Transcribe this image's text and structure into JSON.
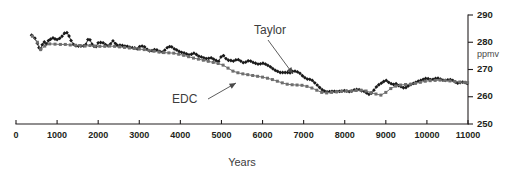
{
  "figure": {
    "background_color": "#ffffff",
    "text_color": "#231f20"
  },
  "axes": {
    "x_title": "Years",
    "y_unit": "ppmv",
    "x_ticks": [
      "0",
      "1000",
      "2000",
      "3000",
      "4000",
      "5000",
      "6000",
      "7000",
      "8000",
      "9000",
      "10000",
      "11000"
    ],
    "y_ticks": [
      "290",
      "280",
      "270",
      "260",
      "250"
    ]
  },
  "annotations": {
    "taylor": "Taylor",
    "edc": "EDC"
  },
  "chart_data": {
    "type": "line",
    "title": "",
    "xlabel": "Years",
    "ylabel": "ppmv",
    "xlim": [
      0,
      11000
    ],
    "ylim": [
      250,
      290
    ],
    "grid": false,
    "legend": "annotated-inline",
    "x_ticks": [
      0,
      1000,
      2000,
      3000,
      4000,
      5000,
      6000,
      7000,
      8000,
      9000,
      10000,
      11000
    ],
    "y_ticks": [
      250,
      260,
      270,
      280,
      290
    ],
    "series": [
      {
        "name": "Taylor",
        "color": "#1a1a1a",
        "marker": "filled-diamond",
        "points": [
          [
            380,
            282.6
          ],
          [
            460,
            281.5
          ],
          [
            520,
            279.6
          ],
          [
            560,
            278.0
          ],
          [
            600,
            277.4
          ],
          [
            640,
            279.1
          ],
          [
            690,
            280.1
          ],
          [
            740,
            279.4
          ],
          [
            790,
            280.6
          ],
          [
            840,
            281.1
          ],
          [
            900,
            281.6
          ],
          [
            950,
            281.2
          ],
          [
            1000,
            281.0
          ],
          [
            1060,
            281.4
          ],
          [
            1120,
            282.2
          ],
          [
            1180,
            283.3
          ],
          [
            1240,
            283.5
          ],
          [
            1290,
            282.3
          ],
          [
            1340,
            280.6
          ],
          [
            1400,
            279.2
          ],
          [
            1460,
            278.7
          ],
          [
            1520,
            278.6
          ],
          [
            1580,
            278.6
          ],
          [
            1640,
            278.7
          ],
          [
            1700,
            279.2
          ],
          [
            1750,
            281.0
          ],
          [
            1800,
            280.9
          ],
          [
            1850,
            279.3
          ],
          [
            1900,
            278.5
          ],
          [
            1950,
            278.4
          ],
          [
            2000,
            279.8
          ],
          [
            2060,
            279.9
          ],
          [
            2120,
            279.8
          ],
          [
            2180,
            279.1
          ],
          [
            2240,
            278.7
          ],
          [
            2300,
            279.4
          ],
          [
            2360,
            280.5
          ],
          [
            2420,
            279.5
          ],
          [
            2470,
            278.8
          ],
          [
            2530,
            278.9
          ],
          [
            2590,
            278.8
          ],
          [
            2650,
            278.6
          ],
          [
            2710,
            278.5
          ],
          [
            2770,
            278.2
          ],
          [
            2830,
            278.0
          ],
          [
            2890,
            277.9
          ],
          [
            2950,
            277.6
          ],
          [
            3010,
            278.4
          ],
          [
            3070,
            278.6
          ],
          [
            3130,
            278.3
          ],
          [
            3190,
            277.4
          ],
          [
            3250,
            276.8
          ],
          [
            3310,
            276.9
          ],
          [
            3370,
            277.3
          ],
          [
            3430,
            277.2
          ],
          [
            3500,
            276.6
          ],
          [
            3560,
            276.4
          ],
          [
            3620,
            277.1
          ],
          [
            3680,
            278.0
          ],
          [
            3740,
            278.4
          ],
          [
            3790,
            278.3
          ],
          [
            3850,
            277.6
          ],
          [
            3910,
            277.2
          ],
          [
            3970,
            276.6
          ],
          [
            4030,
            276.3
          ],
          [
            4090,
            276.1
          ],
          [
            4150,
            275.7
          ],
          [
            4210,
            275.4
          ],
          [
            4270,
            275.6
          ],
          [
            4330,
            276.0
          ],
          [
            4390,
            275.5
          ],
          [
            4450,
            274.9
          ],
          [
            4510,
            274.6
          ],
          [
            4570,
            274.3
          ],
          [
            4630,
            274.0
          ],
          [
            4690,
            274.1
          ],
          [
            4750,
            274.3
          ],
          [
            4810,
            273.8
          ],
          [
            4870,
            273.3
          ],
          [
            4930,
            273.0
          ],
          [
            4990,
            274.6
          ],
          [
            5050,
            275.1
          ],
          [
            5110,
            274.0
          ],
          [
            5170,
            273.4
          ],
          [
            5230,
            273.3
          ],
          [
            5290,
            273.1
          ],
          [
            5350,
            273.5
          ],
          [
            5410,
            273.6
          ],
          [
            5470,
            273.1
          ],
          [
            5530,
            272.5
          ],
          [
            5590,
            272.7
          ],
          [
            5650,
            273.2
          ],
          [
            5710,
            273.1
          ],
          [
            5770,
            272.6
          ],
          [
            5830,
            272.3
          ],
          [
            5890,
            272.0
          ],
          [
            5950,
            272.1
          ],
          [
            6010,
            272.3
          ],
          [
            6070,
            272.0
          ],
          [
            6130,
            271.5
          ],
          [
            6190,
            271.0
          ],
          [
            6250,
            270.3
          ],
          [
            6310,
            269.7
          ],
          [
            6370,
            269.3
          ],
          [
            6430,
            268.9
          ],
          [
            6490,
            268.9
          ],
          [
            6550,
            268.9
          ],
          [
            6610,
            268.9
          ],
          [
            6670,
            268.8
          ],
          [
            6730,
            269.3
          ],
          [
            6790,
            269.4
          ],
          [
            6850,
            269.1
          ],
          [
            6910,
            268.6
          ],
          [
            6970,
            267.7
          ],
          [
            7030,
            267.0
          ],
          [
            7090,
            266.5
          ],
          [
            7150,
            266.4
          ],
          [
            7210,
            266.0
          ],
          [
            7270,
            265.1
          ],
          [
            7330,
            264.3
          ],
          [
            7390,
            263.4
          ],
          [
            7450,
            262.6
          ],
          [
            7510,
            262.1
          ],
          [
            7570,
            261.8
          ],
          [
            7630,
            261.9
          ],
          [
            7690,
            262.0
          ],
          [
            7750,
            262.0
          ],
          [
            7810,
            261.9
          ],
          [
            7870,
            262.0
          ],
          [
            7930,
            262.1
          ],
          [
            7990,
            262.2
          ],
          [
            8050,
            262.1
          ],
          [
            8110,
            261.9
          ],
          [
            8170,
            262.1
          ],
          [
            8230,
            262.5
          ],
          [
            8290,
            262.7
          ],
          [
            8350,
            262.6
          ],
          [
            8410,
            262.2
          ],
          [
            8470,
            262.0
          ],
          [
            8530,
            261.4
          ],
          [
            8590,
            260.9
          ],
          [
            8650,
            261.3
          ],
          [
            8710,
            262.4
          ],
          [
            8770,
            263.6
          ],
          [
            8830,
            264.4
          ],
          [
            8890,
            265.0
          ],
          [
            8950,
            265.6
          ],
          [
            9010,
            266.0
          ],
          [
            9070,
            265.3
          ],
          [
            9130,
            264.8
          ],
          [
            9190,
            264.5
          ],
          [
            9250,
            264.8
          ],
          [
            9310,
            264.1
          ],
          [
            9370,
            263.7
          ],
          [
            9430,
            263.3
          ],
          [
            9490,
            263.4
          ],
          [
            9550,
            264.0
          ],
          [
            9610,
            264.5
          ],
          [
            9670,
            264.9
          ],
          [
            9730,
            265.3
          ],
          [
            9790,
            265.7
          ],
          [
            9850,
            266.0
          ],
          [
            9910,
            266.4
          ],
          [
            9970,
            266.7
          ],
          [
            10030,
            266.6
          ],
          [
            10090,
            266.3
          ],
          [
            10150,
            266.4
          ],
          [
            10210,
            266.7
          ],
          [
            10270,
            266.8
          ],
          [
            10330,
            266.5
          ],
          [
            10390,
            266.1
          ],
          [
            10450,
            266.0
          ],
          [
            10510,
            266.2
          ],
          [
            10570,
            266.3
          ],
          [
            10630,
            266.0
          ],
          [
            10690,
            265.4
          ],
          [
            10750,
            265.0
          ],
          [
            10810,
            265.2
          ],
          [
            10870,
            265.4
          ],
          [
            10930,
            265.2
          ],
          [
            10980,
            264.9
          ]
        ]
      },
      {
        "name": "EDC",
        "color": "#6e6e6e",
        "marker": "filled-square",
        "points": [
          [
            400,
            282.2
          ],
          [
            520,
            280.0
          ],
          [
            600,
            277.3
          ],
          [
            700,
            278.6
          ],
          [
            820,
            279.4
          ],
          [
            950,
            279.3
          ],
          [
            1080,
            279.2
          ],
          [
            1200,
            279.2
          ],
          [
            1320,
            279.0
          ],
          [
            1450,
            278.9
          ],
          [
            1560,
            278.8
          ],
          [
            1680,
            278.6
          ],
          [
            1800,
            278.8
          ],
          [
            1920,
            278.6
          ],
          [
            2040,
            278.5
          ],
          [
            2160,
            278.5
          ],
          [
            2280,
            278.6
          ],
          [
            2400,
            278.5
          ],
          [
            2520,
            278.3
          ],
          [
            2640,
            278.1
          ],
          [
            2760,
            277.9
          ],
          [
            2880,
            277.7
          ],
          [
            3000,
            277.5
          ],
          [
            3120,
            277.3
          ],
          [
            3240,
            277.0
          ],
          [
            3360,
            276.7
          ],
          [
            3480,
            276.4
          ],
          [
            3600,
            276.2
          ],
          [
            3720,
            276.1
          ],
          [
            3840,
            276.0
          ],
          [
            3960,
            275.6
          ],
          [
            4080,
            275.2
          ],
          [
            4200,
            274.7
          ],
          [
            4320,
            274.2
          ],
          [
            4440,
            273.8
          ],
          [
            4560,
            273.4
          ],
          [
            4680,
            273.0
          ],
          [
            4800,
            272.6
          ],
          [
            4920,
            272.2
          ],
          [
            5040,
            271.6
          ],
          [
            5160,
            270.5
          ],
          [
            5280,
            269.4
          ],
          [
            5400,
            268.8
          ],
          [
            5520,
            268.4
          ],
          [
            5640,
            268.1
          ],
          [
            5760,
            267.8
          ],
          [
            5880,
            267.5
          ],
          [
            6000,
            267.2
          ],
          [
            6120,
            266.8
          ],
          [
            6240,
            266.3
          ],
          [
            6360,
            265.7
          ],
          [
            6480,
            265.1
          ],
          [
            6600,
            264.6
          ],
          [
            6720,
            264.4
          ],
          [
            6840,
            264.3
          ],
          [
            6960,
            264.2
          ],
          [
            7080,
            263.8
          ],
          [
            7200,
            263.2
          ],
          [
            7320,
            262.4
          ],
          [
            7440,
            261.6
          ],
          [
            7560,
            261.4
          ],
          [
            7680,
            261.6
          ],
          [
            7800,
            261.8
          ],
          [
            7920,
            262.0
          ],
          [
            8040,
            262.1
          ],
          [
            8160,
            262.1
          ],
          [
            8280,
            262.3
          ],
          [
            8400,
            262.4
          ],
          [
            8520,
            262.1
          ],
          [
            8640,
            261.5
          ],
          [
            8760,
            261.0
          ],
          [
            8880,
            260.6
          ],
          [
            9000,
            261.6
          ],
          [
            9120,
            263.0
          ],
          [
            9240,
            263.9
          ],
          [
            9360,
            264.3
          ],
          [
            9480,
            264.5
          ],
          [
            9600,
            264.6
          ],
          [
            9720,
            264.9
          ],
          [
            9840,
            265.3
          ],
          [
            9960,
            265.7
          ],
          [
            10080,
            265.9
          ],
          [
            10200,
            266.0
          ],
          [
            10320,
            266.1
          ],
          [
            10440,
            266.0
          ],
          [
            10560,
            265.8
          ],
          [
            10680,
            265.6
          ],
          [
            10800,
            265.4
          ],
          [
            10920,
            265.3
          ],
          [
            10990,
            265.2
          ]
        ]
      }
    ]
  }
}
